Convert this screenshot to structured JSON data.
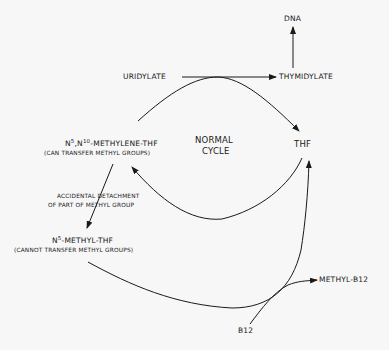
{
  "diagram": {
    "type": "pathway",
    "title": "",
    "nodes": {
      "dna": {
        "label": "DNA"
      },
      "uridylate": {
        "label": "URIDYLATE"
      },
      "thymidylate": {
        "label": "THYMIDYLATE"
      },
      "methylene_thf": {
        "label_prefix": "N",
        "sup1": "5",
        "mid": ",N",
        "sup2": "10",
        "label_suffix": "-METHYLENE-THF",
        "note": "(CAN TRANSFER METHYL GROUPS)"
      },
      "normal_cycle": {
        "line1": "NORMAL",
        "line2": "CYCLE"
      },
      "thf": {
        "label": "THF"
      },
      "methyl_thf": {
        "label_prefix": "N",
        "sup1": "5",
        "label_suffix": "-METHYL-THF",
        "note": "(CANNOT TRANSFER METHYL GROUPS)"
      },
      "methyl_b12": {
        "label": "METHYL-B12"
      },
      "b12": {
        "label": "B12"
      }
    },
    "edge_labels": {
      "accidental_line1": "ACCIDENTAL DETACHMENT",
      "accidental_line2": "OF PART OF METHYL GROUP"
    },
    "edges": [
      {
        "from": "uridylate",
        "to": "thymidylate"
      },
      {
        "from": "thymidylate",
        "to": "dna"
      },
      {
        "from": "methylene_thf",
        "to": "thf",
        "via": "arc over uridylate→thymidylate"
      },
      {
        "from": "thf",
        "to": "methylene_thf",
        "via": "lower arc (normal cycle)"
      },
      {
        "from": "methylene_thf",
        "to": "methyl_thf",
        "label": "accidental detachment of part of methyl group"
      },
      {
        "from": "methyl_thf",
        "to": "thf",
        "via": "long lower curve"
      },
      {
        "from": "b12",
        "to": "methyl_b12"
      }
    ],
    "colors": {
      "background": "#f7f7f7",
      "ink": "#1a1a1a"
    }
  }
}
